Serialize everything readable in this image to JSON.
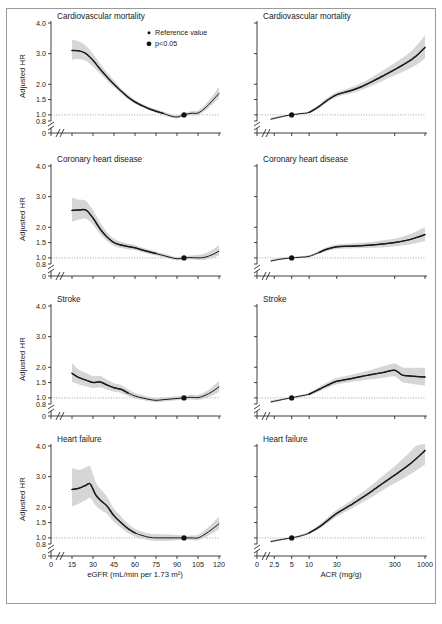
{
  "figure": {
    "caption": "",
    "legend": {
      "items": [
        {
          "id": "reference-value",
          "label": "Reference value",
          "marker": "small-dot"
        },
        {
          "id": "p-significant",
          "label": "p<0.05",
          "marker": "large-dot"
        }
      ]
    },
    "colors": {
      "curve": "#1a1a1a",
      "confidence_band": "#cfcfcf",
      "reference_line": "#7d7d7d",
      "axis": "#2a2a2a",
      "frame": "#9a9a9a"
    }
  },
  "axes": {
    "y": {
      "label": "Adjusted HR",
      "ticks": [
        "0",
        "0.8",
        "1.0",
        "1.5",
        "2.0",
        "3.0",
        "4.0"
      ],
      "values": [
        0,
        0.8,
        1.0,
        1.5,
        2.0,
        3.0,
        4.0
      ],
      "break": true,
      "reference_value": 1.0
    },
    "x_egfr": {
      "label": "eGFR (mL/min per 1.73 m²)",
      "ticks": [
        "0",
        "15",
        "30",
        "45",
        "60",
        "75",
        "90",
        "105",
        "120"
      ],
      "values": [
        0,
        15,
        30,
        45,
        60,
        75,
        90,
        105,
        120
      ],
      "break": true,
      "scale": "linear"
    },
    "x_acr": {
      "label": "ACR (mg/g)",
      "ticks": [
        "0",
        "2.5",
        "5",
        "10",
        "30",
        "300",
        "1000"
      ],
      "values": [
        0,
        2.5,
        5,
        10,
        30,
        300,
        1000
      ],
      "break": true,
      "scale": "log"
    }
  },
  "chart_data": [
    {
      "id": "cvd-mortality-egfr",
      "type": "line",
      "title": "Cardiovascular mortality",
      "column": "left",
      "row": 0,
      "xlabel": "eGFR (mL/min per 1.73 m²)",
      "ylabel": "Adjusted HR",
      "xlim": [
        12,
        120
      ],
      "ylim": [
        0.8,
        4.0
      ],
      "grid": false,
      "reference_point": {
        "x": 95,
        "y": 1.0
      },
      "x": [
        15,
        20,
        25,
        30,
        35,
        40,
        45,
        50,
        55,
        60,
        65,
        70,
        75,
        80,
        85,
        90,
        95,
        100,
        105,
        110,
        115,
        120
      ],
      "series": [
        {
          "name": "Adjusted HR",
          "values": [
            3.1,
            3.09,
            3.0,
            2.78,
            2.5,
            2.24,
            2.0,
            1.78,
            1.58,
            1.42,
            1.3,
            1.2,
            1.12,
            1.05,
            0.97,
            0.93,
            1.0,
            1.05,
            1.06,
            1.22,
            1.45,
            1.7
          ]
        },
        {
          "name": "CI lower",
          "values": [
            2.8,
            2.82,
            2.76,
            2.58,
            2.35,
            2.12,
            1.9,
            1.7,
            1.51,
            1.36,
            1.25,
            1.15,
            1.07,
            1.0,
            0.92,
            0.88,
            0.95,
            0.99,
            0.99,
            1.13,
            1.33,
            1.55
          ]
        },
        {
          "name": "CI upper",
          "values": [
            3.45,
            3.4,
            3.26,
            3.0,
            2.68,
            2.38,
            2.12,
            1.87,
            1.66,
            1.49,
            1.36,
            1.26,
            1.18,
            1.11,
            1.03,
            0.99,
            1.06,
            1.12,
            1.14,
            1.33,
            1.6,
            1.92
          ]
        }
      ],
      "significance_from": 15,
      "significance_to": 80
    },
    {
      "id": "cvd-mortality-acr",
      "type": "line",
      "title": "Cardiovascular mortality",
      "column": "right",
      "row": 0,
      "xlabel": "ACR (mg/g)",
      "ylabel": "Adjusted HR",
      "xlim": [
        2.0,
        1000
      ],
      "ylim": [
        0.8,
        4.0
      ],
      "grid": false,
      "reference_point": {
        "x": 5,
        "y": 1.0
      },
      "x": [
        2.2,
        3,
        4,
        5,
        7,
        10,
        15,
        20,
        30,
        50,
        80,
        120,
        200,
        300,
        500,
        700,
        1000
      ],
      "series": [
        {
          "name": "Adjusted HR",
          "values": [
            0.86,
            0.92,
            0.97,
            1.0,
            1.04,
            1.08,
            1.28,
            1.46,
            1.66,
            1.78,
            1.92,
            2.08,
            2.3,
            2.48,
            2.72,
            2.92,
            3.2
          ]
        },
        {
          "name": "CI lower",
          "values": [
            0.82,
            0.89,
            0.95,
            0.98,
            1.01,
            1.05,
            1.22,
            1.39,
            1.58,
            1.69,
            1.81,
            1.95,
            2.14,
            2.29,
            2.48,
            2.63,
            2.84
          ]
        },
        {
          "name": "CI upper",
          "values": [
            0.91,
            0.96,
            1.0,
            1.02,
            1.07,
            1.12,
            1.34,
            1.54,
            1.75,
            1.88,
            2.04,
            2.22,
            2.48,
            2.69,
            2.98,
            3.24,
            3.6
          ]
        }
      ],
      "significance_from": 10,
      "significance_to": 1000
    },
    {
      "id": "coronary-heart-disease-egfr",
      "type": "line",
      "title": "Coronary heart disease",
      "column": "left",
      "row": 1,
      "xlabel": "eGFR (mL/min per 1.73 m²)",
      "ylabel": "Adjusted HR",
      "xlim": [
        12,
        120
      ],
      "ylim": [
        0.8,
        4.0
      ],
      "grid": false,
      "reference_point": {
        "x": 95,
        "y": 1.0
      },
      "x": [
        15,
        20,
        25,
        30,
        35,
        40,
        45,
        50,
        55,
        60,
        65,
        70,
        75,
        80,
        85,
        90,
        95,
        100,
        105,
        110,
        115,
        120
      ],
      "series": [
        {
          "name": "Adjusted HR",
          "values": [
            2.55,
            2.56,
            2.56,
            2.3,
            1.95,
            1.68,
            1.5,
            1.42,
            1.37,
            1.33,
            1.26,
            1.2,
            1.14,
            1.08,
            1.02,
            0.97,
            1.0,
            1.01,
            1.0,
            1.02,
            1.1,
            1.22
          ]
        },
        {
          "name": "CI lower",
          "values": [
            2.18,
            2.25,
            2.28,
            2.08,
            1.78,
            1.55,
            1.39,
            1.32,
            1.28,
            1.25,
            1.19,
            1.13,
            1.08,
            1.02,
            0.96,
            0.92,
            0.95,
            0.95,
            0.93,
            0.94,
            1.0,
            1.08
          ]
        },
        {
          "name": "CI upper",
          "values": [
            2.96,
            2.9,
            2.86,
            2.56,
            2.16,
            1.84,
            1.63,
            1.53,
            1.47,
            1.42,
            1.34,
            1.27,
            1.21,
            1.15,
            1.08,
            1.03,
            1.06,
            1.08,
            1.09,
            1.14,
            1.26,
            1.42
          ]
        }
      ],
      "significance_from": 15,
      "significance_to": 78
    },
    {
      "id": "coronary-heart-disease-acr",
      "type": "line",
      "title": "Coronary heart disease",
      "column": "right",
      "row": 1,
      "xlabel": "ACR (mg/g)",
      "ylabel": "Adjusted HR",
      "xlim": [
        2.0,
        1000
      ],
      "ylim": [
        0.8,
        4.0
      ],
      "grid": false,
      "reference_point": {
        "x": 5,
        "y": 1.0
      },
      "x": [
        2.2,
        3,
        4,
        5,
        7,
        10,
        15,
        20,
        30,
        50,
        80,
        120,
        200,
        300,
        500,
        700,
        1000
      ],
      "series": [
        {
          "name": "Adjusted HR",
          "values": [
            0.9,
            0.95,
            0.98,
            1.0,
            1.02,
            1.05,
            1.18,
            1.28,
            1.36,
            1.38,
            1.4,
            1.42,
            1.46,
            1.5,
            1.58,
            1.66,
            1.76
          ]
        },
        {
          "name": "CI lower",
          "values": [
            0.86,
            0.92,
            0.96,
            0.98,
            1.0,
            1.02,
            1.13,
            1.22,
            1.29,
            1.31,
            1.32,
            1.33,
            1.35,
            1.38,
            1.43,
            1.48,
            1.55
          ]
        },
        {
          "name": "CI upper",
          "values": [
            0.95,
            0.99,
            1.01,
            1.02,
            1.05,
            1.09,
            1.24,
            1.35,
            1.44,
            1.46,
            1.49,
            1.52,
            1.58,
            1.63,
            1.75,
            1.86,
            2.0
          ]
        }
      ],
      "significance_from": 12,
      "significance_to": 1000
    },
    {
      "id": "stroke-egfr",
      "type": "line",
      "title": "Stroke",
      "column": "left",
      "row": 2,
      "xlabel": "eGFR (mL/min per 1.73 m²)",
      "ylabel": "Adjusted HR",
      "xlim": [
        12,
        120
      ],
      "ylim": [
        0.8,
        4.0
      ],
      "grid": false,
      "reference_point": {
        "x": 95,
        "y": 1.0
      },
      "x": [
        15,
        20,
        25,
        30,
        35,
        40,
        45,
        50,
        55,
        60,
        65,
        70,
        75,
        80,
        85,
        90,
        95,
        100,
        105,
        110,
        115,
        120
      ],
      "series": [
        {
          "name": "Adjusted HR",
          "values": [
            1.8,
            1.66,
            1.58,
            1.5,
            1.52,
            1.42,
            1.33,
            1.28,
            1.16,
            1.06,
            1.0,
            0.95,
            0.92,
            0.94,
            0.96,
            0.98,
            1.0,
            1.02,
            1.01,
            1.08,
            1.2,
            1.36
          ]
        },
        {
          "name": "CI lower",
          "values": [
            1.52,
            1.44,
            1.38,
            1.32,
            1.35,
            1.27,
            1.2,
            1.16,
            1.06,
            0.98,
            0.93,
            0.89,
            0.86,
            0.88,
            0.9,
            0.92,
            0.94,
            0.95,
            0.93,
            0.98,
            1.07,
            1.19
          ]
        },
        {
          "name": "CI upper",
          "values": [
            2.14,
            1.92,
            1.81,
            1.71,
            1.72,
            1.59,
            1.48,
            1.42,
            1.28,
            1.16,
            1.09,
            1.03,
            0.99,
            1.01,
            1.03,
            1.05,
            1.07,
            1.1,
            1.1,
            1.19,
            1.35,
            1.56
          ]
        }
      ],
      "significance_from": 15,
      "significance_to": 55
    },
    {
      "id": "stroke-acr",
      "type": "line",
      "title": "Stroke",
      "column": "right",
      "row": 2,
      "xlabel": "ACR (mg/g)",
      "ylabel": "Adjusted HR",
      "xlim": [
        2.0,
        1000
      ],
      "ylim": [
        0.8,
        4.0
      ],
      "grid": false,
      "reference_point": {
        "x": 5,
        "y": 1.0
      },
      "x": [
        2.2,
        3,
        4,
        5,
        7,
        10,
        15,
        20,
        30,
        50,
        80,
        120,
        200,
        300,
        400,
        500,
        700,
        1000
      ],
      "series": [
        {
          "name": "Adjusted HR",
          "values": [
            0.87,
            0.92,
            0.97,
            1.0,
            1.06,
            1.12,
            1.28,
            1.4,
            1.54,
            1.62,
            1.7,
            1.76,
            1.84,
            1.9,
            1.75,
            1.72,
            1.7,
            1.68
          ]
        },
        {
          "name": "CI lower",
          "values": [
            0.83,
            0.89,
            0.95,
            0.98,
            1.03,
            1.08,
            1.21,
            1.32,
            1.44,
            1.51,
            1.57,
            1.61,
            1.66,
            1.7,
            1.52,
            1.48,
            1.44,
            1.4
          ]
        },
        {
          "name": "CI upper",
          "values": [
            0.92,
            0.96,
            1.0,
            1.02,
            1.1,
            1.17,
            1.36,
            1.49,
            1.65,
            1.74,
            1.84,
            1.92,
            2.04,
            2.12,
            2.0,
            1.98,
            1.98,
            1.98
          ]
        }
      ],
      "significance_from": 10,
      "significance_to": 1000
    },
    {
      "id": "heart-failure-egfr",
      "type": "line",
      "title": "Heart failure",
      "column": "left",
      "row": 3,
      "xlabel": "eGFR (mL/min per 1.73 m²)",
      "ylabel": "Adjusted HR",
      "xlim": [
        12,
        120
      ],
      "ylim": [
        0.8,
        4.0
      ],
      "grid": false,
      "reference_point": {
        "x": 95,
        "y": 1.0
      },
      "x": [
        15,
        20,
        25,
        28,
        32,
        36,
        40,
        45,
        50,
        55,
        60,
        65,
        70,
        75,
        80,
        85,
        90,
        95,
        100,
        105,
        110,
        115,
        120
      ],
      "series": [
        {
          "name": "Adjusted HR",
          "values": [
            2.58,
            2.62,
            2.72,
            2.76,
            2.4,
            2.2,
            2.04,
            1.72,
            1.5,
            1.3,
            1.16,
            1.08,
            1.02,
            1.0,
            1.0,
            1.0,
            1.0,
            1.0,
            1.0,
            1.0,
            1.12,
            1.28,
            1.46
          ]
        },
        {
          "name": "CI lower",
          "values": [
            2.02,
            2.12,
            2.24,
            2.3,
            2.05,
            1.9,
            1.78,
            1.52,
            1.33,
            1.16,
            1.04,
            0.97,
            0.92,
            0.9,
            0.9,
            0.91,
            0.92,
            0.94,
            0.93,
            0.92,
            1.01,
            1.14,
            1.28
          ]
        },
        {
          "name": "CI upper",
          "values": [
            3.28,
            3.22,
            3.3,
            3.32,
            2.82,
            2.56,
            2.34,
            1.95,
            1.7,
            1.46,
            1.3,
            1.21,
            1.14,
            1.12,
            1.12,
            1.11,
            1.09,
            1.07,
            1.08,
            1.1,
            1.26,
            1.46,
            1.7
          ]
        }
      ],
      "significance_from": 15,
      "significance_to": 62
    },
    {
      "id": "heart-failure-acr",
      "type": "line",
      "title": "Heart failure",
      "column": "right",
      "row": 3,
      "xlabel": "ACR (mg/g)",
      "ylabel": "Adjusted HR",
      "xlim": [
        2.0,
        1000
      ],
      "ylim": [
        0.8,
        4.0
      ],
      "grid": false,
      "reference_point": {
        "x": 5,
        "y": 1.0
      },
      "x": [
        2.2,
        3,
        4,
        5,
        7,
        10,
        15,
        20,
        30,
        50,
        80,
        120,
        200,
        300,
        500,
        700,
        1000
      ],
      "series": [
        {
          "name": "Adjusted HR",
          "values": [
            0.88,
            0.93,
            0.97,
            1.0,
            1.06,
            1.16,
            1.36,
            1.54,
            1.8,
            2.05,
            2.3,
            2.52,
            2.82,
            3.05,
            3.35,
            3.58,
            3.85
          ]
        },
        {
          "name": "CI lower",
          "values": [
            0.84,
            0.9,
            0.95,
            0.98,
            1.03,
            1.12,
            1.29,
            1.45,
            1.69,
            1.92,
            2.14,
            2.33,
            2.59,
            2.78,
            3.02,
            3.2,
            3.4
          ]
        },
        {
          "name": "CI upper",
          "values": [
            0.93,
            0.97,
            1.0,
            1.02,
            1.1,
            1.21,
            1.44,
            1.64,
            1.92,
            2.19,
            2.47,
            2.72,
            3.07,
            3.34,
            3.72,
            4.0,
            4.35
          ]
        }
      ],
      "significance_from": 8,
      "significance_to": 1000
    }
  ]
}
